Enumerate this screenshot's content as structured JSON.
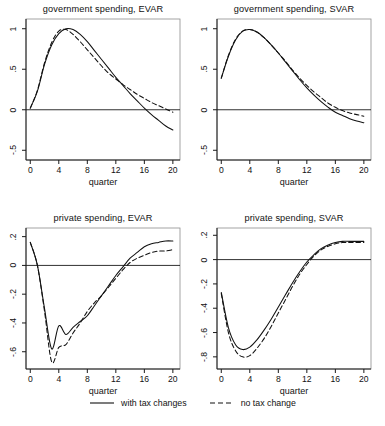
{
  "figure": {
    "xlabel": "quarter",
    "legend": [
      {
        "label": "with tax changes",
        "style": "solid"
      },
      {
        "label": "no tax change",
        "style": "dashed"
      }
    ]
  },
  "chart_data": [
    {
      "type": "line",
      "title": "government spending, EVAR",
      "xlabel": "quarter",
      "ylabel": "",
      "xlim": [
        -0.6,
        21.0
      ],
      "ylim": [
        -0.62,
        1.12
      ],
      "xticks": [
        0,
        4,
        8,
        12,
        16,
        20
      ],
      "xticklabels": [
        "0",
        "4",
        "8",
        "12",
        "16",
        "20"
      ],
      "yticks": [
        -0.5,
        0,
        0.5,
        1
      ],
      "yticklabels": [
        "-.5",
        "0",
        ".5",
        "1"
      ],
      "grid": false,
      "zeroline": true,
      "x": [
        0,
        1,
        2,
        3,
        4,
        5,
        6,
        7,
        8,
        9,
        10,
        11,
        12,
        13,
        14,
        15,
        16,
        17,
        18,
        19,
        20
      ],
      "series": [
        {
          "name": "with tax changes",
          "style": "solid",
          "values": [
            0.02,
            0.23,
            0.56,
            0.8,
            0.94,
            1.0,
            0.99,
            0.93,
            0.84,
            0.73,
            0.62,
            0.51,
            0.4,
            0.3,
            0.2,
            0.11,
            0.02,
            -0.06,
            -0.13,
            -0.2,
            -0.25
          ]
        },
        {
          "name": "no tax change",
          "style": "dashed",
          "values": [
            0.02,
            0.24,
            0.58,
            0.83,
            0.97,
            0.99,
            0.93,
            0.84,
            0.74,
            0.64,
            0.54,
            0.45,
            0.38,
            0.31,
            0.25,
            0.19,
            0.14,
            0.09,
            0.05,
            0.01,
            -0.03
          ]
        }
      ]
    },
    {
      "type": "line",
      "title": "government spending, SVAR",
      "xlabel": "quarter",
      "ylabel": "",
      "xlim": [
        -0.6,
        21.0
      ],
      "ylim": [
        -0.62,
        1.12
      ],
      "xticks": [
        0,
        4,
        8,
        12,
        16,
        20
      ],
      "xticklabels": [
        "0",
        "4",
        "8",
        "12",
        "16",
        "20"
      ],
      "yticks": [
        -0.5,
        0,
        0.5,
        1
      ],
      "yticklabels": [
        "-.5",
        "0",
        ".5",
        "1"
      ],
      "grid": false,
      "zeroline": true,
      "x": [
        0,
        1,
        2,
        3,
        4,
        5,
        6,
        7,
        8,
        9,
        10,
        11,
        12,
        13,
        14,
        15,
        16,
        17,
        18,
        19,
        20
      ],
      "series": [
        {
          "name": "with tax changes",
          "style": "solid",
          "values": [
            0.39,
            0.66,
            0.86,
            0.97,
            0.99,
            0.96,
            0.89,
            0.8,
            0.7,
            0.59,
            0.48,
            0.37,
            0.27,
            0.18,
            0.1,
            0.03,
            -0.03,
            -0.07,
            -0.11,
            -0.14,
            -0.16
          ]
        },
        {
          "name": "no tax change",
          "style": "dashed",
          "values": [
            0.39,
            0.67,
            0.87,
            0.97,
            0.99,
            0.96,
            0.89,
            0.8,
            0.7,
            0.6,
            0.49,
            0.39,
            0.3,
            0.22,
            0.15,
            0.08,
            0.03,
            -0.01,
            -0.04,
            -0.06,
            -0.08
          ]
        }
      ]
    },
    {
      "type": "line",
      "title": "private spending, EVAR",
      "xlabel": "quarter",
      "ylabel": "",
      "xlim": [
        -0.6,
        21.0
      ],
      "ylim": [
        -0.72,
        0.26
      ],
      "xticks": [
        0,
        4,
        8,
        12,
        16,
        20
      ],
      "xticklabels": [
        "0",
        "4",
        "8",
        "12",
        "16",
        "20"
      ],
      "yticks": [
        -0.6,
        -0.4,
        -0.2,
        0,
        0.2
      ],
      "yticklabels": [
        "-.6",
        "-.4",
        "-.2",
        "0",
        ".2"
      ],
      "grid": false,
      "zeroline": true,
      "x": [
        0,
        1,
        2,
        3,
        4,
        5,
        6,
        7,
        8,
        9,
        10,
        11,
        12,
        13,
        14,
        15,
        16,
        17,
        18,
        19,
        20
      ],
      "series": [
        {
          "name": "with tax changes",
          "style": "solid",
          "values": [
            0.16,
            0.0,
            -0.3,
            -0.58,
            -0.42,
            -0.48,
            -0.43,
            -0.39,
            -0.35,
            -0.28,
            -0.21,
            -0.14,
            -0.07,
            -0.01,
            0.05,
            0.09,
            0.13,
            0.15,
            0.16,
            0.17,
            0.17
          ]
        },
        {
          "name": "no tax change",
          "style": "dashed",
          "values": [
            0.16,
            0.0,
            -0.32,
            -0.67,
            -0.57,
            -0.55,
            -0.47,
            -0.4,
            -0.32,
            -0.26,
            -0.21,
            -0.15,
            -0.09,
            -0.03,
            0.02,
            0.05,
            0.07,
            0.09,
            0.1,
            0.1,
            0.11
          ]
        }
      ]
    },
    {
      "type": "line",
      "title": "private spending, SVAR",
      "xlabel": "quarter",
      "ylabel": "",
      "xlim": [
        -0.6,
        21.0
      ],
      "ylim": [
        -0.9,
        0.26
      ],
      "xticks": [
        0,
        4,
        8,
        12,
        16,
        20
      ],
      "xticklabels": [
        "0",
        "4",
        "8",
        "12",
        "16",
        "20"
      ],
      "yticks": [
        -0.8,
        -0.6,
        -0.4,
        -0.2,
        0,
        0.2
      ],
      "yticklabels": [
        "-.8",
        "-.6",
        "-.4",
        "-.2",
        "0",
        ".2"
      ],
      "grid": false,
      "zeroline": true,
      "x": [
        0,
        1,
        2,
        3,
        4,
        5,
        6,
        7,
        8,
        9,
        10,
        11,
        12,
        13,
        14,
        15,
        16,
        17,
        18,
        19,
        20
      ],
      "series": [
        {
          "name": "with tax changes",
          "style": "solid",
          "values": [
            -0.27,
            -0.56,
            -0.7,
            -0.74,
            -0.72,
            -0.66,
            -0.58,
            -0.49,
            -0.39,
            -0.29,
            -0.19,
            -0.1,
            -0.02,
            0.04,
            0.09,
            0.12,
            0.14,
            0.15,
            0.15,
            0.15,
            0.15
          ]
        },
        {
          "name": "no tax change",
          "style": "dashed",
          "values": [
            -0.28,
            -0.6,
            -0.75,
            -0.8,
            -0.79,
            -0.73,
            -0.65,
            -0.55,
            -0.44,
            -0.33,
            -0.22,
            -0.12,
            -0.04,
            0.03,
            0.08,
            0.11,
            0.13,
            0.14,
            0.14,
            0.14,
            0.14
          ]
        }
      ]
    }
  ]
}
